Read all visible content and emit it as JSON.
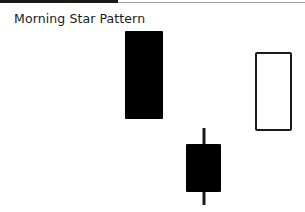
{
  "title": "Morning Star Pattern",
  "colors": {
    "bearish_fill": "#000000",
    "bullish_fill": "#ffffff",
    "outline": "#1a1a1a",
    "rule_dark": "#1a1a1a",
    "rule_light": "#9a9a9a"
  },
  "chart_data": {
    "type": "candlestick",
    "title": "Morning Star Pattern",
    "xlabel": "",
    "ylabel": "",
    "grid": false,
    "legend": null,
    "candles": [
      {
        "index": 1,
        "direction": "bearish",
        "body_x": [
          125,
          163
        ],
        "body_y": [
          31,
          119
        ],
        "wick": null
      },
      {
        "index": 2,
        "direction": "bearish",
        "body_x": [
          186,
          221
        ],
        "body_y": [
          144,
          192
        ],
        "wick_x": 204,
        "wick_y": [
          128,
          205
        ]
      },
      {
        "index": 3,
        "direction": "bullish",
        "body_x": [
          255,
          292
        ],
        "body_y": [
          52,
          131
        ],
        "wick": null
      }
    ]
  }
}
